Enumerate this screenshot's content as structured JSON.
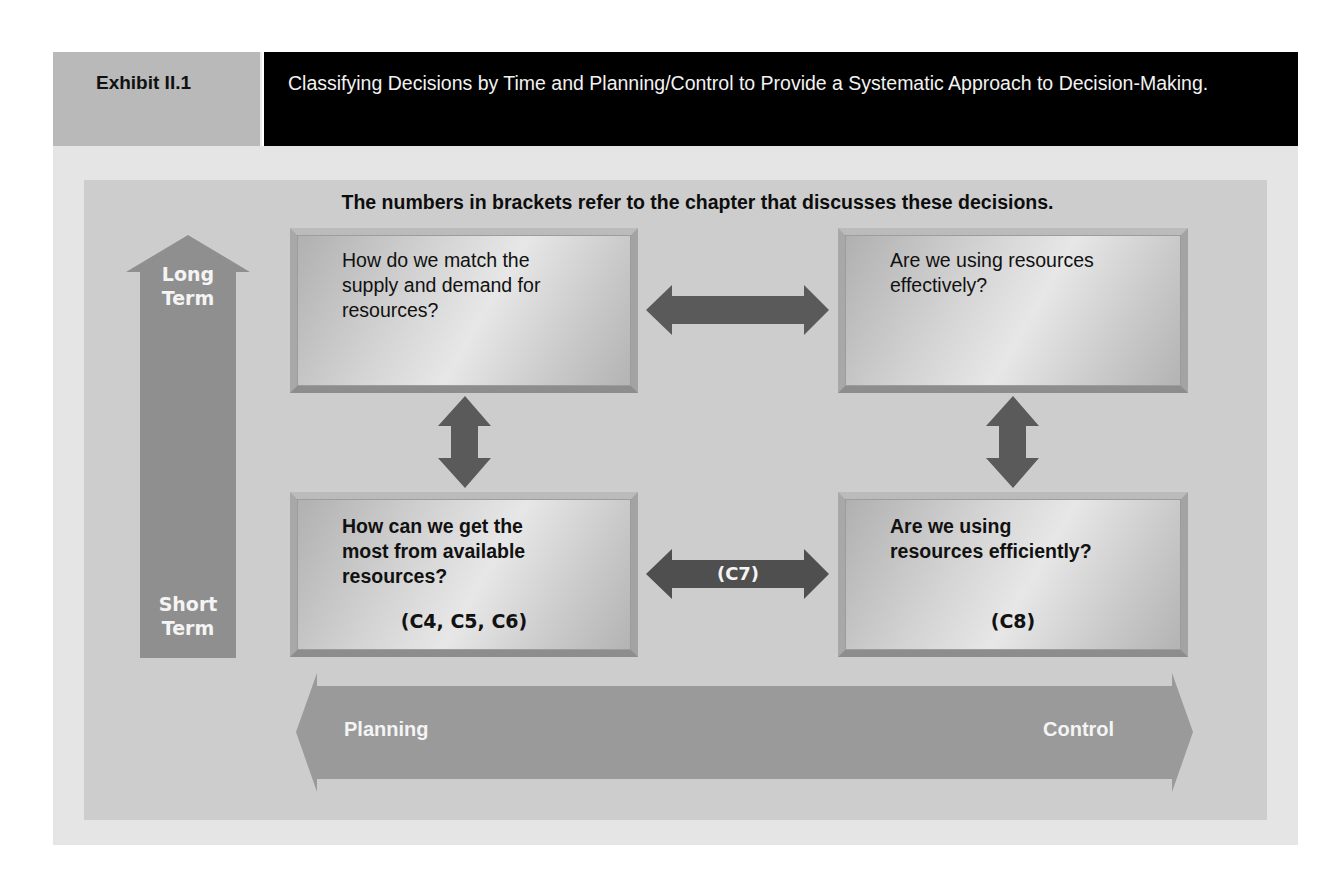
{
  "header": {
    "exhibit_label": "Exhibit II.1",
    "title": "Classifying Decisions by Time and Planning/Control to Provide a Systematic Approach to Decision-Making."
  },
  "diagram": {
    "note": "The numbers in brackets refer to the chapter that discusses these decisions.",
    "time_axis": {
      "top_label": "Long Term",
      "top_label_lines": [
        "Long",
        "Term"
      ],
      "bottom_label": "Short Term",
      "bottom_label_lines": [
        "Short",
        "Term"
      ]
    },
    "planning_control_axis": {
      "left_label": "Planning",
      "right_label": "Control"
    },
    "boxes": {
      "top_left": {
        "question": "How do we match the supply and demand for resources?",
        "lines": [
          "How do we match the",
          "supply and demand for",
          "resources?"
        ],
        "reference": ""
      },
      "top_right": {
        "question": "Are we using resources effectively?",
        "lines": [
          "Are we using resources",
          "effectively?"
        ],
        "reference": ""
      },
      "bottom_left": {
        "question": "How can we get the most from available resources?",
        "lines": [
          "How can we get the",
          "most from available",
          "resources?"
        ],
        "reference": "(C4, C5, C6)"
      },
      "bottom_right": {
        "question": "Are we using resources efficiently?",
        "lines": [
          "Are we using",
          "resources efficiently?"
        ],
        "reference": "(C8)"
      }
    },
    "connectors": {
      "top_horizontal": {
        "label": ""
      },
      "bottom_horizontal": {
        "label": "(C7)"
      },
      "left_vertical": {
        "label": ""
      },
      "right_vertical": {
        "label": ""
      }
    },
    "colors": {
      "header_label_bg": "#b9b9b9",
      "header_title_bg": "#000000",
      "outer_panel": "#e5e5e5",
      "inner_panel": "#cdcdcd",
      "axis_arrow": "#8f8f8f",
      "connector_arrow": "#5a5a5a"
    }
  }
}
